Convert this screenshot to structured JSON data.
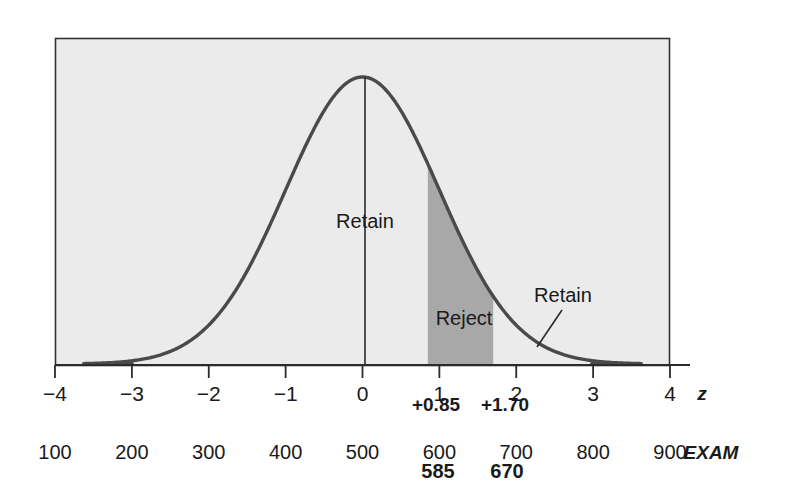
{
  "chart_data": {
    "type": "area",
    "title": "",
    "subtitle": "",
    "xlabel": "z",
    "ylabel": "",
    "grid": false,
    "legend_position": "none",
    "curve": {
      "distribution": "standard-normal",
      "mean": 0,
      "sd": 1,
      "x_start": -3.62,
      "x_end": 3.62,
      "peak_value": 0.3989
    },
    "x_axis": {
      "name": "z",
      "min": -4,
      "max": 4,
      "ticks": [
        -4,
        -3,
        -2,
        -1,
        0,
        1,
        2,
        3,
        4
      ],
      "tick_labels": [
        "−4",
        "−3",
        "−2",
        "−1",
        "0",
        "1",
        "2",
        "3",
        "4"
      ]
    },
    "secondary_axis": {
      "name": "EXAM",
      "min": 100,
      "max": 900,
      "ticks": [
        100,
        200,
        300,
        400,
        500,
        600,
        700,
        800,
        900
      ],
      "tick_labels": [
        "100",
        "200",
        "300",
        "400",
        "500",
        "600",
        "700",
        "800",
        "900"
      ]
    },
    "shaded_region": {
      "label": "Reject",
      "z_from": 0.85,
      "z_to": 1.7,
      "color": "#a8a8a8"
    },
    "markers": [
      {
        "z_label": "+0.85",
        "z_value": 0.85,
        "exam_label": "585",
        "exam_value": 585
      },
      {
        "z_label": "+1.70",
        "z_value": 1.7,
        "exam_label": "670",
        "exam_value": 670
      }
    ],
    "annotations": [
      {
        "text": "Retain",
        "z": 0.0,
        "kind": "center-line-label"
      },
      {
        "text": "Reject",
        "z": 1.27,
        "kind": "shaded-region-label"
      },
      {
        "text": "Retain",
        "z": 2.25,
        "kind": "leader-line-label"
      }
    ],
    "center_line": {
      "z": 0,
      "label": "Retain"
    }
  },
  "plot": {
    "panel_color": "#ebebeb",
    "border_color": "#333333",
    "curve_color": "#4a4a4a",
    "axis_color": "#2b2b2b",
    "shade_color": "#a8a8a8",
    "text_color": "#1a1a1a"
  },
  "labels": {
    "axis_z": "z",
    "axis_exam": "EXAM",
    "retain_center": "Retain",
    "reject": "Reject",
    "retain_tail": "Retain",
    "z_marker_1": "+0.85",
    "z_marker_2": "+1.70",
    "exam_marker_1": "585",
    "exam_marker_2": "670",
    "z_ticks": [
      "−4",
      "−3",
      "−2",
      "−1",
      "0",
      "1",
      "2",
      "3",
      "4"
    ],
    "exam_ticks": [
      "100",
      "200",
      "300",
      "400",
      "500",
      "600",
      "700",
      "800",
      "900"
    ]
  }
}
